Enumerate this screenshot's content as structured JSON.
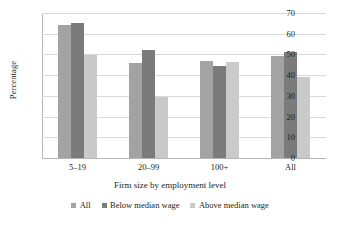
{
  "chart_data": {
    "type": "bar",
    "title": "",
    "subtitle": "",
    "xlabel": "Firm size by employment level",
    "ylabel": "Percentage",
    "categories": [
      "5–19",
      "20–99",
      "100+",
      "All"
    ],
    "series": [
      {
        "name": "All",
        "values": [
          64.0,
          46.0,
          47.0,
          49.3
        ],
        "color": "#a3a3a3"
      },
      {
        "name": "Below median wage",
        "values": [
          65.0,
          52.0,
          44.5,
          51.0
        ],
        "color": "#7b7b7b"
      },
      {
        "name": "Above median wage",
        "values": [
          49.7,
          29.5,
          46.5,
          39.3
        ],
        "color": "#cacaca"
      }
    ],
    "ylim": [
      0,
      70
    ],
    "ytick_step": 10,
    "yticks": [
      0,
      10,
      20,
      30,
      40,
      50,
      60,
      70
    ],
    "ytick_labels": [
      "0",
      "10",
      "20",
      "30",
      "40",
      "50",
      "60",
      "70"
    ],
    "grid": "horizontal",
    "legend_position": "bottom",
    "annotations": []
  },
  "legend": {
    "items": [
      {
        "label": "All"
      },
      {
        "label": "Below median wage"
      },
      {
        "label": "Above median wage"
      }
    ]
  }
}
